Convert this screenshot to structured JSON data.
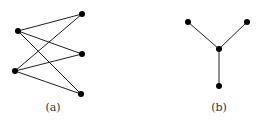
{
  "figures": [
    {
      "id": "a",
      "caption": "(a)",
      "caption_pos": [
        53,
        111
      ],
      "nodes": [
        [
          18,
          31
        ],
        [
          15,
          71
        ],
        [
          82,
          14
        ],
        [
          82,
          54
        ],
        [
          81,
          94
        ]
      ],
      "edges": [
        [
          0,
          2
        ],
        [
          0,
          3
        ],
        [
          0,
          4
        ],
        [
          1,
          2
        ],
        [
          1,
          3
        ],
        [
          1,
          4
        ]
      ]
    },
    {
      "id": "b",
      "caption": "(b)",
      "caption_pos": [
        219,
        111
      ],
      "nodes": [
        [
          188,
          22
        ],
        [
          247,
          22
        ],
        [
          219,
          49
        ],
        [
          219,
          86
        ]
      ],
      "edges": [
        [
          0,
          2
        ],
        [
          1,
          2
        ],
        [
          2,
          3
        ]
      ]
    }
  ],
  "colors": {
    "edge": "#222222",
    "node": "#000000"
  }
}
